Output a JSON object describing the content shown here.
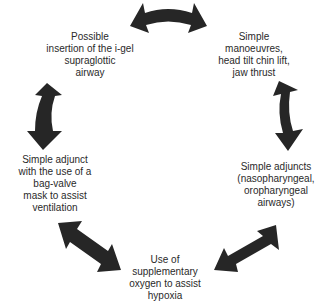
{
  "diagram": {
    "type": "cycle",
    "arrow_color": "#262626",
    "text_color": "#2a2a2a",
    "nodes": [
      {
        "id": "simple-manoeuvres",
        "lines": [
          "Simple",
          "manoeuvres,",
          "head tilt chin lift,",
          "jaw thrust"
        ]
      },
      {
        "id": "simple-adjuncts",
        "lines": [
          "Simple adjuncts",
          "(nasopharyngeal,",
          "oropharyngeal",
          "airways)"
        ]
      },
      {
        "id": "supplementary-oxygen",
        "lines": [
          "Use of",
          "supplementary",
          "oxygen to assist",
          "hypoxia"
        ]
      },
      {
        "id": "bag-valve-mask",
        "lines": [
          "Simple adjunct",
          "with the use of a",
          "bag-valve",
          "mask to assist",
          "ventilation"
        ]
      },
      {
        "id": "i-gel",
        "lines": [
          "Possible",
          "insertion of the i-gel",
          "supraglottic",
          "airway"
        ]
      }
    ],
    "edges": [
      {
        "from": "i-gel",
        "to": "simple-manoeuvres",
        "style": "double-headed-curved"
      },
      {
        "from": "simple-manoeuvres",
        "to": "simple-adjuncts",
        "style": "double-headed-curved"
      },
      {
        "from": "simple-adjuncts",
        "to": "supplementary-oxygen",
        "style": "double-headed"
      },
      {
        "from": "supplementary-oxygen",
        "to": "bag-valve-mask",
        "style": "double-headed"
      },
      {
        "from": "bag-valve-mask",
        "to": "i-gel",
        "style": "double-headed-curved"
      }
    ]
  }
}
